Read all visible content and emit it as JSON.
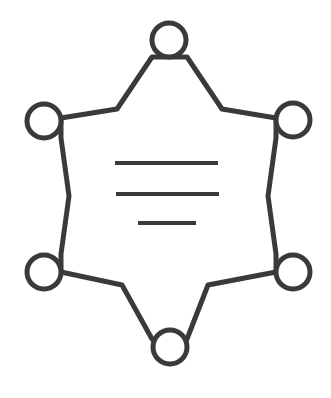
{
  "document": {
    "title": "Six-Pointed Star Badge Icon",
    "background_color": "#ffffff",
    "width": 331,
    "height": 398
  },
  "icon": {
    "name": "sheriff-star-badge-icon",
    "description": "Outline of a six-pointed star badge with a ring at each point and three horizontal text lines inside",
    "stroke_color": "#3a3a3a",
    "fill_color": "none",
    "outline_stroke_width": 5,
    "ring_stroke_width": 5,
    "ring_radius": 17,
    "star_outline_path": "M 169 57 L 152 57 L 117 109 L 61 118 L 61 138 L 69 196 L 61 254 L 61 272 L 122 285 L 152 339 L 187 339 L 208 285 L 276 272 L 276 254 L 268 196 L 276 138 L 276 118 L 222 109 L 187 57 Z"
  },
  "points": [
    {
      "name": "point-top",
      "label": "Top point",
      "cx": 169,
      "cy": 40
    },
    {
      "name": "point-top-left",
      "label": "Top left point",
      "cx": 44,
      "cy": 121
    },
    {
      "name": "point-top-right",
      "label": "Top right point",
      "cx": 293,
      "cy": 120
    },
    {
      "name": "point-bottom-left",
      "label": "Bottom left point",
      "cx": 44,
      "cy": 272
    },
    {
      "name": "point-bottom-right",
      "label": "Bottom right point",
      "cx": 293,
      "cy": 272
    },
    {
      "name": "point-bottom",
      "label": "Bottom point",
      "cx": 170,
      "cy": 347
    }
  ],
  "inner_lines": [
    {
      "name": "text-line-1",
      "x1": 115,
      "x2": 218,
      "y": 163,
      "thickness": 4
    },
    {
      "name": "text-line-2",
      "x1": 116,
      "x2": 219,
      "y": 194,
      "thickness": 4
    },
    {
      "name": "text-line-3",
      "x1": 138,
      "x2": 196,
      "y": 223,
      "thickness": 4
    }
  ]
}
